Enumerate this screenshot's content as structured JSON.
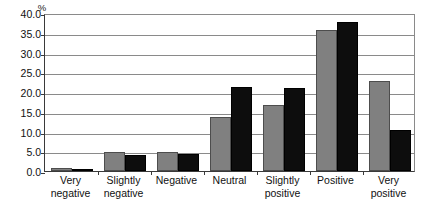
{
  "chart_data": {
    "type": "bar",
    "title": "",
    "xlabel": "",
    "ylabel": "%",
    "ylim": [
      0,
      40
    ],
    "ytick_step": 5,
    "ytick_labels": [
      "40.0",
      "35.0",
      "30.0",
      "25.0",
      "20.0",
      "15.0",
      "10.0",
      "5.0",
      "0.0"
    ],
    "ytick_values": [
      40,
      35,
      30,
      25,
      20,
      15,
      10,
      5,
      0
    ],
    "grid": true,
    "legend": "none",
    "categories": [
      "Very negative",
      "Slightly negative",
      "Negative",
      "Neutral",
      "Slightly positive",
      "Positive",
      "Very positive"
    ],
    "category_label_lines": [
      [
        "Very",
        "negative"
      ],
      [
        "Slightly",
        "negative"
      ],
      [
        "Negative",
        ""
      ],
      [
        "Neutral",
        ""
      ],
      [
        "Slightly",
        "positive"
      ],
      [
        "Positive",
        ""
      ],
      [
        "Very",
        "positive"
      ]
    ],
    "series": [
      {
        "name": "series-a",
        "color": "#808080",
        "values": [
          0.7,
          4.9,
          4.8,
          13.8,
          16.8,
          35.6,
          22.8
        ]
      },
      {
        "name": "series-b",
        "color": "#0d0d0d",
        "values": [
          0.4,
          4.0,
          4.4,
          21.3,
          20.9,
          37.6,
          10.4
        ]
      }
    ]
  },
  "colors": {
    "series_a": "#808080",
    "series_b": "#0d0d0d",
    "gridline": "#8a8a8a",
    "axis": "#3a3a3a",
    "text": "#111111",
    "background": "#ffffff"
  }
}
